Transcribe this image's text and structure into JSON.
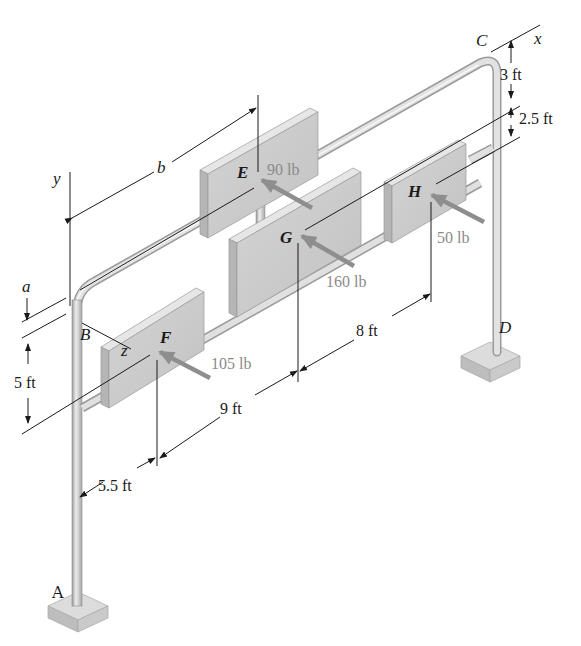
{
  "diagram": {
    "type": "3d-frame-with-sign-panels",
    "colors": {
      "pipe": "#d6d6d6",
      "pipe_edge": "#9a9a9a",
      "panel_face": "#cdcdcd",
      "panel_top": "#e6e6e6",
      "panel_side": "#b5b5b5",
      "force_arrow": "#8e8e8e",
      "force_text": "#8a8a8a",
      "line": "#1a1a1a",
      "base": "#cfcfcf"
    },
    "axes": {
      "x": "x",
      "y": "y",
      "z": "z"
    },
    "points": {
      "A": "A",
      "B": "B",
      "C": "C",
      "D": "D",
      "E": "E",
      "F": "F",
      "G": "G",
      "H": "H"
    },
    "forces": {
      "E": "90 lb",
      "F": "105 lb",
      "G": "160 lb",
      "H": "50 lb"
    },
    "dimensions": {
      "a": "a",
      "b": "b",
      "top_offset": "3 ft",
      "h_offset": "2.5 ft",
      "left_height": "5 ft",
      "ff": "5.5 ft",
      "fg": "9 ft",
      "gh": "8 ft"
    }
  }
}
